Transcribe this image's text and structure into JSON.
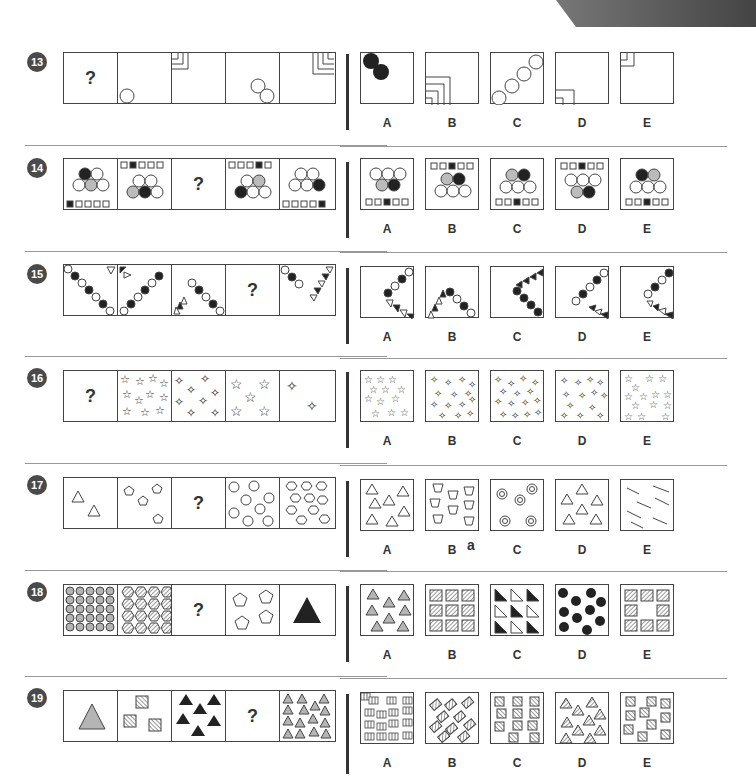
{
  "page": {
    "questions": [
      {
        "number": "13",
        "question_mark": "?",
        "options": [
          "A",
          "B",
          "C",
          "D",
          "E"
        ],
        "sequence": [
          "?",
          "one circle bottom-left",
          "three nested corner brackets top-left",
          "two circles diagonal",
          "four nested corner brackets top-right"
        ],
        "option_desc": [
          "two black circles top-left",
          "three nested corners bottom-left",
          "four circles diagonal",
          "two nested corners bottom-left",
          "two nested corners top-left"
        ]
      },
      {
        "number": "14",
        "question_mark": "?",
        "options": [
          "A",
          "B",
          "C",
          "D",
          "E"
        ],
        "sequence": [
          "circle pyramid, black top-left, square row bottom (1st black)",
          "square row top (2nd black), circle pyramid",
          "?",
          "square row top (4th black), circle pyramid",
          "circle pyramid, square row bottom (5th black)"
        ],
        "option_desc": [
          "inverted pyramid, square row bottom 3rd black",
          "square row top 3rd black",
          "pyramid, square row bottom 3rd black",
          "square row top 3rd black, inverted pyramid",
          "pyramid, square row bottom 3rd black"
        ]
      },
      {
        "number": "15",
        "question_mark": "?",
        "options": [
          "A",
          "B",
          "C",
          "D",
          "E"
        ],
        "sequence": [
          "circle chain diagonal down-right",
          "circle chain diagonal up-right with triangles",
          "triangles and circle chain",
          "?",
          "circles and triangles"
        ],
        "option_desc": [
          "circles up-right with triangles below",
          "triangles and circles arch",
          "triangles and black circles",
          "circles and triangles",
          "circles and triangles"
        ]
      },
      {
        "number": "16",
        "question_mark": "?",
        "options": [
          "A",
          "B",
          "C",
          "D",
          "E"
        ],
        "sequence": [
          "?",
          "many small stars",
          "many four-point stars",
          "five stars",
          "two four-point stars"
        ],
        "option_desc": [
          "stars 13",
          "four-point stars",
          "four-point stars dense",
          "four-point stars",
          "stars dense"
        ]
      },
      {
        "number": "17",
        "question_mark": "?",
        "options": [
          "A",
          "B",
          "C",
          "D",
          "E"
        ],
        "sequence": [
          "two triangles",
          "four pentagons",
          "?",
          "ten circles",
          "twelve hexagons"
        ],
        "option_desc": [
          "seven triangles",
          "trapezoids",
          "five concentric circles",
          "six triangles",
          "diagonal lines"
        ],
        "stray_mark": "a"
      },
      {
        "number": "18",
        "question_mark": "?",
        "options": [
          "A",
          "B",
          "C",
          "D",
          "E"
        ],
        "sequence": [
          "25 grey circles",
          "16 hatched hexagons",
          "?",
          "four pentagons",
          "one black triangle"
        ],
        "option_desc": [
          "eight grey triangles",
          "nine hatched squares",
          "nine right triangles",
          "ten black circles",
          "eight hatched squares"
        ]
      },
      {
        "number": "19",
        "question_mark": "?",
        "options": [
          "A",
          "B",
          "C",
          "D",
          "E"
        ],
        "sequence": [
          "one grey triangle",
          "three hatched squares",
          "six black triangles",
          "?",
          "fifteen grey triangles"
        ],
        "option_desc": [
          "striped rectangles",
          "rotated hatched squares",
          "hatched squares",
          "hatched triangles",
          "hatched squares"
        ]
      }
    ]
  },
  "colors": {
    "black": "#222222",
    "grey": "#b5b5b5",
    "line": "#444444",
    "badge": "#4a4a4a"
  }
}
